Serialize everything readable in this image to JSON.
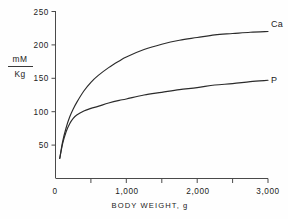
{
  "chart_data": {
    "type": "line",
    "title": "",
    "xlabel": "BODY WEIGHT, g",
    "ylabel": "mM/Kg",
    "ylabel_numerator": "mM",
    "ylabel_denominator": "Kg",
    "xlim": [
      0,
      3000
    ],
    "ylim": [
      0,
      250
    ],
    "grid": false,
    "legend_position": "inline-right",
    "x_ticks": [
      0,
      500,
      1000,
      1500,
      2000,
      2500,
      3000
    ],
    "x_tick_labels": [
      "0",
      "",
      "1,000",
      "",
      "2,000",
      "",
      "3,000"
    ],
    "y_ticks": [
      0,
      50,
      100,
      150,
      200,
      250
    ],
    "y_tick_labels": [
      "0",
      "50",
      "100",
      "150",
      "200",
      "250"
    ],
    "x": [
      60,
      100,
      150,
      200,
      250,
      300,
      400,
      500,
      600,
      750,
      900,
      1000,
      1250,
      1500,
      1750,
      2000,
      2250,
      2500,
      2750,
      3000
    ],
    "series": [
      {
        "name": "Ca",
        "label": "Ca",
        "color": "#2b2b2b",
        "values": [
          30,
          55,
          76,
          92,
          104,
          114,
          131,
          144,
          154,
          166,
          176,
          182,
          193,
          201,
          207,
          211,
          215,
          217,
          219,
          220
        ]
      },
      {
        "name": "P",
        "label": "P",
        "color": "#2b2b2b",
        "values": [
          30,
          52,
          70,
          82,
          90,
          95,
          101,
          105,
          108,
          113,
          117,
          119,
          125,
          129,
          133,
          136,
          140,
          142,
          145,
          147
        ]
      }
    ],
    "annotations": [
      {
        "text": "Ca",
        "x": 3000,
        "y": 220
      },
      {
        "text": "P",
        "x": 3000,
        "y": 147
      }
    ]
  }
}
